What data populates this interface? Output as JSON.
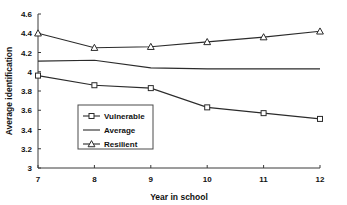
{
  "chart_data": {
    "type": "line",
    "title": "",
    "xlabel": "Year in school",
    "ylabel": "Average identification",
    "x": [
      7,
      8,
      9,
      10,
      11,
      12
    ],
    "xticklabels": [
      "7",
      "8",
      "9",
      "10",
      "11",
      "12"
    ],
    "xlim": [
      7,
      12
    ],
    "ylim": [
      3,
      4.6
    ],
    "yticks": [
      3,
      3.2,
      3.4,
      3.6,
      3.8,
      4,
      4.2,
      4.4,
      4.6
    ],
    "yticklabels": [
      "3",
      "3.2",
      "3.4",
      "3.6",
      "3.8",
      "4",
      "4.2",
      "4.4",
      "4.6"
    ],
    "grid": false,
    "legend_position": "center-left-inside",
    "series": [
      {
        "name": "Vulnerable",
        "marker": "open-square",
        "values": [
          3.96,
          3.86,
          3.83,
          3.63,
          3.57,
          3.51
        ]
      },
      {
        "name": "Average",
        "marker": "none",
        "values": [
          4.11,
          4.12,
          4.04,
          4.03,
          4.03,
          4.03
        ]
      },
      {
        "name": "Resilient",
        "marker": "open-triangle",
        "values": [
          4.4,
          4.25,
          4.26,
          4.31,
          4.36,
          4.42
        ]
      }
    ],
    "colors": {
      "line": "#2b2b2b",
      "axis": "#3a3a3a",
      "text": "#111111",
      "background": "#ffffff",
      "marker_fill": "#ffffff"
    }
  },
  "legend": {
    "items": [
      {
        "label": "Vulnerable"
      },
      {
        "label": "Average"
      },
      {
        "label": "Resilient"
      }
    ]
  }
}
